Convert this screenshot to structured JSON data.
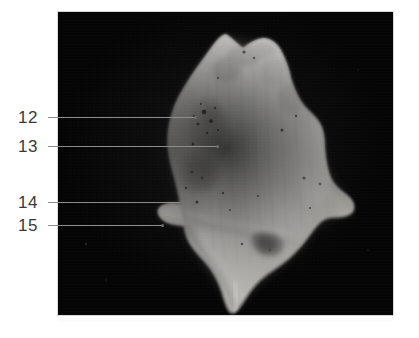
{
  "figure": {
    "background_color": "#ffffff",
    "panel_color": "#040404",
    "label_text_color": "#3a3a3a",
    "leader_color": "#8d8d8d",
    "specimen_color_light": "#e7e6e2",
    "specimen_color_mid": "#c9c7c2",
    "specimen_color_shadow": "#8e8c88",
    "photo_panel": {
      "left": 58,
      "top": 12,
      "width": 335,
      "height": 303
    }
  },
  "callouts": [
    {
      "id": "callout-12",
      "number": "12",
      "label_x": 18,
      "label_y": 109,
      "line_x": 48,
      "line_y": 117,
      "line_width": 148,
      "dot_x": 194,
      "dot_y": 116
    },
    {
      "id": "callout-13",
      "number": "13",
      "label_x": 18,
      "label_y": 138,
      "line_x": 48,
      "line_y": 146,
      "line_width": 170,
      "dot_x": 216,
      "dot_y": 145
    },
    {
      "id": "callout-14",
      "number": "14",
      "label_x": 18,
      "label_y": 194,
      "line_x": 48,
      "line_y": 202,
      "line_width": 134,
      "dot_x": 180,
      "dot_y": 201
    },
    {
      "id": "callout-15",
      "number": "15",
      "label_x": 18,
      "label_y": 217,
      "line_x": 48,
      "line_y": 225,
      "line_width": 115,
      "dot_x": 161,
      "dot_y": 224
    }
  ]
}
